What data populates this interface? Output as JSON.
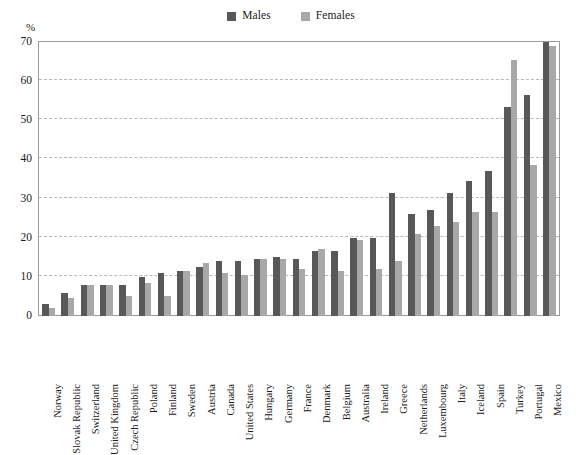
{
  "chart_data": {
    "type": "bar",
    "title": "",
    "subtitle": "",
    "xlabel": "",
    "ylabel": "%",
    "ylim": [
      0,
      70
    ],
    "yticks": [
      0,
      10,
      20,
      30,
      40,
      50,
      60,
      70
    ],
    "ytick_labels": [
      "0",
      "10",
      "20",
      "30",
      "40",
      "50",
      "60",
      "70"
    ],
    "grid": "horizontal-dashed",
    "legend_position": "top-center",
    "categories": [
      "Norway",
      "Slovak Republic",
      "Switzerland",
      "United Kingdom",
      "Czech Republic",
      "Poland",
      "Finland",
      "Sweden",
      "Austria",
      "Canada",
      "United States",
      "Hungary",
      "Germany",
      "France",
      "Denmark",
      "Belgium",
      "Australia",
      "Ireland",
      "Greece",
      "Netherlands",
      "Luxembourg",
      "Italy",
      "Iceland",
      "Spain",
      "Turkey",
      "Portugal",
      "Mexico"
    ],
    "series": [
      {
        "name": "Males",
        "color": "#58585a",
        "values": [
          3,
          6,
          8,
          8,
          8,
          10,
          11,
          11.5,
          12.5,
          14,
          14,
          14.5,
          15,
          14.5,
          16.5,
          16.5,
          20,
          20,
          31.5,
          26,
          27,
          31.5,
          34.5,
          37,
          53.5,
          56.5,
          70
        ]
      },
      {
        "name": "Females",
        "color": "#a8a8a8",
        "values": [
          2,
          4.5,
          8,
          8,
          5,
          8.5,
          5,
          11.5,
          13.5,
          11,
          10.5,
          14.5,
          14.5,
          12,
          17,
          11.5,
          19.5,
          12,
          14,
          21,
          23,
          24,
          26.5,
          26.5,
          65.5,
          38.5,
          69
        ]
      }
    ]
  },
  "legend": {
    "items": [
      {
        "label": "Males",
        "color": "#58585a"
      },
      {
        "label": "Females",
        "color": "#a8a8a8"
      }
    ]
  },
  "axis": {
    "unit_label": "%"
  }
}
